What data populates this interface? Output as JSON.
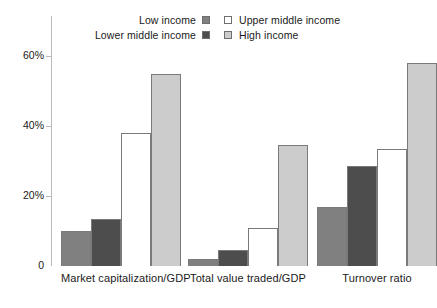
{
  "legend": {
    "rows": [
      {
        "left_label": "Low income",
        "left_swatch": "#808080",
        "right_label": "Upper middle income",
        "right_swatch": "#ffffff"
      },
      {
        "left_label": "Lower middle income",
        "left_swatch": "#4d4d4d",
        "right_label": "High income",
        "right_swatch": "#cccccc"
      }
    ]
  },
  "axis": {
    "ticks": [
      {
        "label": "60%",
        "value": 60
      },
      {
        "label": "40%",
        "value": 40
      },
      {
        "label": "20%",
        "value": 20
      },
      {
        "label": "0",
        "value": 0
      }
    ]
  },
  "colors": {
    "low_income": "#808080",
    "lower_middle_income": "#4d4d4d",
    "upper_middle_income": "#ffffff",
    "high_income": "#cccccc",
    "bar_outline": "#7a7a7a",
    "axis": "#b9b9b9"
  },
  "chart_data": {
    "type": "bar",
    "title": "",
    "xlabel": "",
    "ylabel": "",
    "ylim": [
      0,
      62
    ],
    "grid": false,
    "legend_position": "top",
    "categories": [
      "Market capitalization/GDP",
      "Total value traded/GDP",
      "Turnover ratio"
    ],
    "series": [
      {
        "name": "Low income",
        "values": [
          10.0,
          2.0,
          17.0
        ]
      },
      {
        "name": "Lower middle income",
        "values": [
          13.5,
          4.5,
          28.5
        ]
      },
      {
        "name": "Upper middle income",
        "values": [
          38.0,
          11.0,
          33.5
        ]
      },
      {
        "name": "High income",
        "values": [
          55.0,
          34.5,
          58.0
        ]
      }
    ]
  }
}
